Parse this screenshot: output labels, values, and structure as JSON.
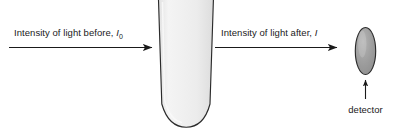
{
  "diagram": {
    "background_color": "#ffffff",
    "stroke_color": "#1a1a1a",
    "beams": {
      "incident": {
        "label_prefix": "Intensity of light before, ",
        "symbol": "I",
        "subscript": "0",
        "arrow_name": "incident-light-arrow"
      },
      "transmitted": {
        "label_prefix": "Intensity of light after, ",
        "symbol": "I",
        "subscript": "",
        "arrow_name": "transmitted-light-arrow"
      }
    },
    "cuvette": {
      "name": "cuvette",
      "fill_top": "#efefef",
      "fill_bottom": "#dcdcdc",
      "outline_color": "#2b2b2b"
    },
    "detector": {
      "label": "detector",
      "fill": "#9a9a9a",
      "outline_color": "#2b2b2b",
      "pointer_name": "detector-pointer-arrow"
    }
  }
}
